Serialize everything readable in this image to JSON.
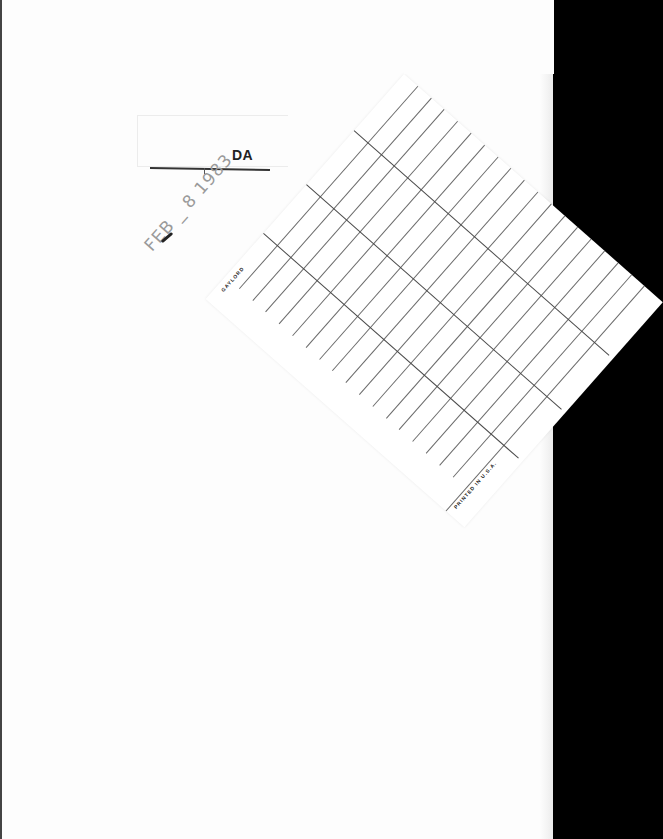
{
  "document": {
    "type": "library book page with date-due slip",
    "header_label": "DATE DUE",
    "header_visible_text": "DA",
    "stamp": {
      "text": "FEB _ 8 1983",
      "color": "#9a9a9a"
    },
    "slip": {
      "maker_imprint": "GAYLORD",
      "print_note": "PRINTED IN U.S.A.",
      "line_color": "#4a4a4a",
      "rows": 18,
      "column_dividers": 3
    },
    "colors": {
      "page": "#fdfdfd",
      "background": "#000000",
      "ink": "#222222"
    }
  }
}
